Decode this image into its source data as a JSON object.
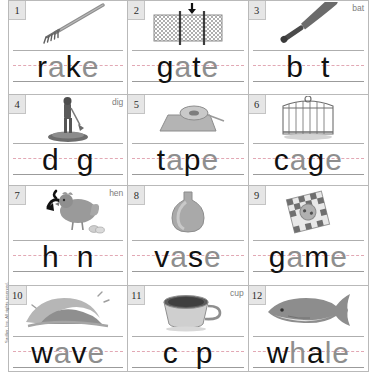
{
  "worksheet": {
    "copyright": "Sadlier, Inc.  All rights reserved.",
    "columns": 3,
    "rows": 4,
    "guide_line_color": "#aeaeae",
    "midline_color": "#e2a8b4",
    "number_badge_bg": "#e6e6e6",
    "traced_letter_color": "#8e8e8e",
    "written_letter_color": "#111111"
  },
  "cells": [
    {
      "number": "1",
      "hint": "",
      "picture": "rake-icon",
      "answer": "rake",
      "parts": [
        {
          "t": "r",
          "s": "solid"
        },
        {
          "t": "a",
          "s": "trace"
        },
        {
          "t": "k",
          "s": "solid"
        },
        {
          "t": "e",
          "s": "trace"
        }
      ]
    },
    {
      "number": "2",
      "hint": "",
      "picture": "gate-icon",
      "answer": "gate",
      "parts": [
        {
          "t": "g",
          "s": "solid"
        },
        {
          "t": "a",
          "s": "trace"
        },
        {
          "t": "t",
          "s": "solid"
        },
        {
          "t": "e",
          "s": "trace"
        }
      ]
    },
    {
      "number": "3",
      "hint": "bat",
      "picture": "bat-icon",
      "answer": "bat",
      "parts": [
        {
          "t": "b",
          "s": "solid"
        },
        {
          "t": "",
          "s": "gap"
        },
        {
          "t": "t",
          "s": "solid"
        }
      ]
    },
    {
      "number": "4",
      "hint": "dig",
      "picture": "dig-icon",
      "answer": "dig",
      "parts": [
        {
          "t": "d",
          "s": "solid"
        },
        {
          "t": "",
          "s": "gap"
        },
        {
          "t": "g",
          "s": "solid"
        }
      ]
    },
    {
      "number": "5",
      "hint": "",
      "picture": "tape-icon",
      "answer": "tape",
      "parts": [
        {
          "t": "t",
          "s": "solid"
        },
        {
          "t": "a",
          "s": "trace"
        },
        {
          "t": "p",
          "s": "solid"
        },
        {
          "t": "e",
          "s": "trace"
        }
      ]
    },
    {
      "number": "6",
      "hint": "",
      "picture": "cage-icon",
      "answer": "cage",
      "parts": [
        {
          "t": "c",
          "s": "solid"
        },
        {
          "t": "a",
          "s": "trace"
        },
        {
          "t": "g",
          "s": "solid"
        },
        {
          "t": "e",
          "s": "trace"
        }
      ]
    },
    {
      "number": "7",
      "hint": "hen",
      "picture": "hen-icon",
      "answer": "hen",
      "parts": [
        {
          "t": "h",
          "s": "solid"
        },
        {
          "t": "",
          "s": "gap"
        },
        {
          "t": "n",
          "s": "solid"
        }
      ]
    },
    {
      "number": "8",
      "hint": "",
      "picture": "vase-icon",
      "answer": "vase",
      "parts": [
        {
          "t": "v",
          "s": "solid"
        },
        {
          "t": "a",
          "s": "trace"
        },
        {
          "t": "s",
          "s": "solid"
        },
        {
          "t": "e",
          "s": "trace"
        }
      ]
    },
    {
      "number": "9",
      "hint": "",
      "picture": "game-icon",
      "answer": "game",
      "parts": [
        {
          "t": "g",
          "s": "solid"
        },
        {
          "t": "a",
          "s": "trace"
        },
        {
          "t": "m",
          "s": "solid"
        },
        {
          "t": "e",
          "s": "trace"
        }
      ]
    },
    {
      "number": "10",
      "hint": "",
      "picture": "wave-icon",
      "answer": "wave",
      "parts": [
        {
          "t": "w",
          "s": "solid"
        },
        {
          "t": "a",
          "s": "trace"
        },
        {
          "t": "v",
          "s": "solid"
        },
        {
          "t": "e",
          "s": "trace"
        }
      ]
    },
    {
      "number": "11",
      "hint": "cup",
      "picture": "cup-icon",
      "answer": "cup",
      "parts": [
        {
          "t": "c",
          "s": "solid"
        },
        {
          "t": "",
          "s": "gap"
        },
        {
          "t": "p",
          "s": "solid"
        }
      ]
    },
    {
      "number": "12",
      "hint": "",
      "picture": "whale-icon",
      "answer": "whale",
      "parts": [
        {
          "t": "w",
          "s": "solid"
        },
        {
          "t": "h",
          "s": "trace"
        },
        {
          "t": "a",
          "s": "solid"
        },
        {
          "t": "l",
          "s": "trace"
        },
        {
          "t": "e",
          "s": "trace"
        }
      ]
    }
  ]
}
